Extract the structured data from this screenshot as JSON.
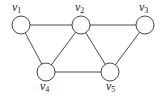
{
  "graph": {
    "nodes": [
      {
        "id": "v1",
        "label": "v",
        "sub": "1",
        "x": 21,
        "y": 25,
        "lx": 12,
        "ly": 11
      },
      {
        "id": "v2",
        "label": "v",
        "sub": "2",
        "x": 81,
        "y": 25,
        "lx": 75,
        "ly": 11
      },
      {
        "id": "v3",
        "label": "v",
        "sub": "3",
        "x": 145,
        "y": 25,
        "lx": 139,
        "ly": 11
      },
      {
        "id": "v4",
        "label": "v",
        "sub": "4",
        "x": 46,
        "y": 72,
        "lx": 40,
        "ly": 90
      },
      {
        "id": "v5",
        "label": "v",
        "sub": "5",
        "x": 110,
        "y": 72,
        "lx": 106,
        "ly": 90
      }
    ],
    "edges": [
      [
        "v1",
        "v2"
      ],
      [
        "v2",
        "v3"
      ],
      [
        "v1",
        "v4"
      ],
      [
        "v2",
        "v4"
      ],
      [
        "v2",
        "v5"
      ],
      [
        "v3",
        "v5"
      ],
      [
        "v4",
        "v5"
      ]
    ],
    "node_radius": 9,
    "stroke_color": "#333333"
  }
}
